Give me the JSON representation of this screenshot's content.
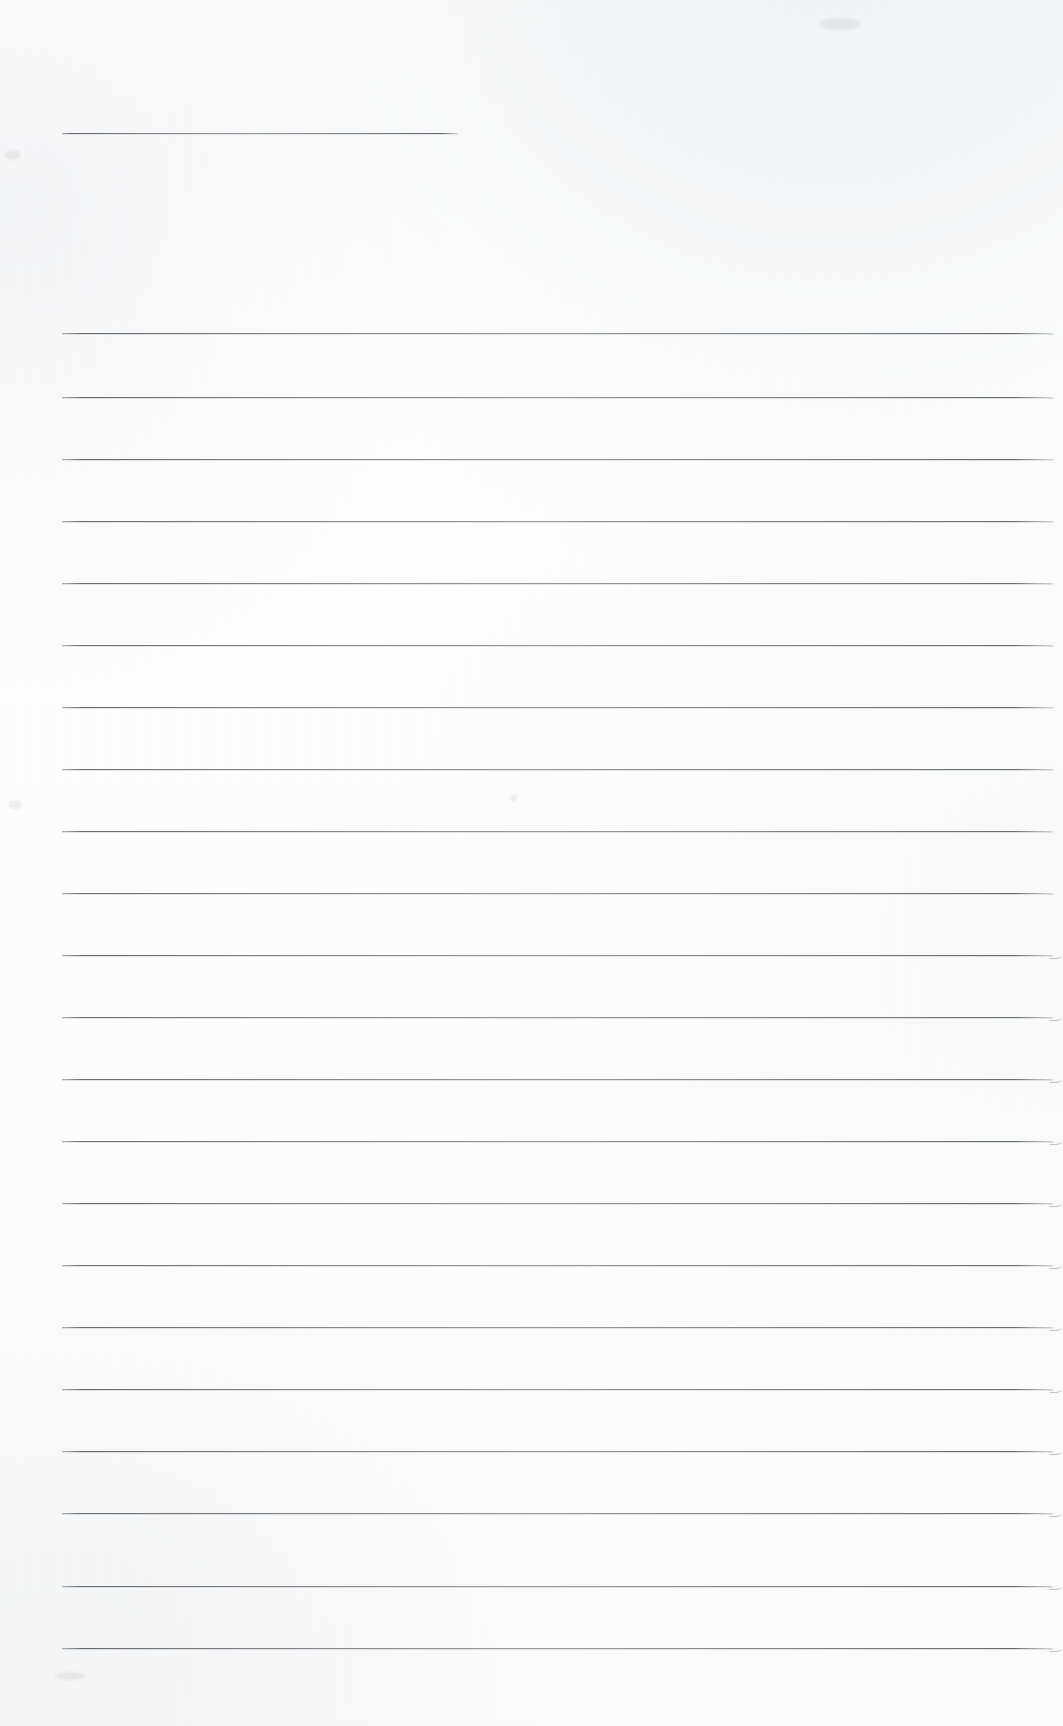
{
  "document": {
    "kind": "scanned-ruled-paper",
    "title": "",
    "visible_text": "",
    "page_width": 1063,
    "page_height": 1726,
    "background_color": "#ffffff",
    "rule_color": "#646a72",
    "rule_thickness_px": 1,
    "writing_area": {
      "left_margin_x": 62,
      "right_edge_x": 1053
    },
    "header_rule": {
      "label": "header-rule",
      "x_start": 62,
      "x_end": 458,
      "y": 133,
      "length": 396
    },
    "body_rules": {
      "count": 22,
      "spacing_px": 62,
      "first_y": 333,
      "last_y": 1648,
      "x_start": 62,
      "x_end": 1053,
      "y_positions": [
        333,
        397,
        460,
        520,
        582,
        645,
        652,
        713,
        775,
        838,
        900,
        962,
        1023,
        1085,
        1147,
        1210,
        1272,
        1310,
        1372,
        1433,
        1497,
        1558,
        1622,
        1648
      ]
    },
    "rules": [
      {
        "name": "rule-header",
        "y": 133,
        "x": 62,
        "width": 396,
        "tail": false
      },
      {
        "name": "rule-01",
        "y": 333,
        "x": 62,
        "width": 991,
        "tail": false
      },
      {
        "name": "rule-02",
        "y": 397,
        "x": 62,
        "width": 991,
        "tail": false
      },
      {
        "name": "rule-03",
        "y": 459,
        "x": 62,
        "width": 991,
        "tail": false
      },
      {
        "name": "rule-04",
        "y": 521,
        "x": 62,
        "width": 991,
        "tail": false
      },
      {
        "name": "rule-05",
        "y": 583,
        "x": 62,
        "width": 991,
        "tail": false
      },
      {
        "name": "rule-06",
        "y": 645,
        "x": 62,
        "width": 991,
        "tail": false
      },
      {
        "name": "rule-07",
        "y": 707,
        "x": 62,
        "width": 991,
        "tail": false
      },
      {
        "name": "rule-08",
        "y": 769,
        "x": 62,
        "width": 991,
        "tail": false
      },
      {
        "name": "rule-09",
        "y": 831,
        "x": 62,
        "width": 991,
        "tail": false
      },
      {
        "name": "rule-10",
        "y": 893,
        "x": 62,
        "width": 991,
        "tail": false
      },
      {
        "name": "rule-11",
        "y": 955,
        "x": 62,
        "width": 991,
        "tail": true
      },
      {
        "name": "rule-12",
        "y": 1017,
        "x": 62,
        "width": 991,
        "tail": true
      },
      {
        "name": "rule-13",
        "y": 1079,
        "x": 62,
        "width": 991,
        "tail": true
      },
      {
        "name": "rule-14",
        "y": 1141,
        "x": 62,
        "width": 991,
        "tail": true
      },
      {
        "name": "rule-15",
        "y": 1203,
        "x": 62,
        "width": 991,
        "tail": true
      },
      {
        "name": "rule-16",
        "y": 1265,
        "x": 62,
        "width": 991,
        "tail": true
      },
      {
        "name": "rule-17",
        "y": 1327,
        "x": 62,
        "width": 991,
        "tail": true
      },
      {
        "name": "rule-18",
        "y": 1389,
        "x": 62,
        "width": 991,
        "tail": true
      },
      {
        "name": "rule-19",
        "y": 1451,
        "x": 62,
        "width": 991,
        "tail": true
      },
      {
        "name": "rule-20",
        "y": 1513,
        "x": 62,
        "width": 991,
        "tail": true
      },
      {
        "name": "rule-21",
        "y": 1586,
        "x": 62,
        "width": 991,
        "tail": true
      },
      {
        "name": "rule-22",
        "y": 1648,
        "x": 62,
        "width": 991,
        "tail": true
      }
    ],
    "smudges": [
      {
        "name": "smudge-top-left",
        "x": 5,
        "y": 150,
        "w": 16,
        "h": 10
      },
      {
        "name": "smudge-mid-left",
        "x": 8,
        "y": 800,
        "w": 14,
        "h": 9
      },
      {
        "name": "smudge-bottom-left",
        "x": 55,
        "y": 1672,
        "w": 30,
        "h": 8
      },
      {
        "name": "smudge-top-right",
        "x": 820,
        "y": 18,
        "w": 40,
        "h": 12
      },
      {
        "name": "smudge-mid-dot",
        "x": 510,
        "y": 795,
        "w": 7,
        "h": 6
      }
    ]
  }
}
